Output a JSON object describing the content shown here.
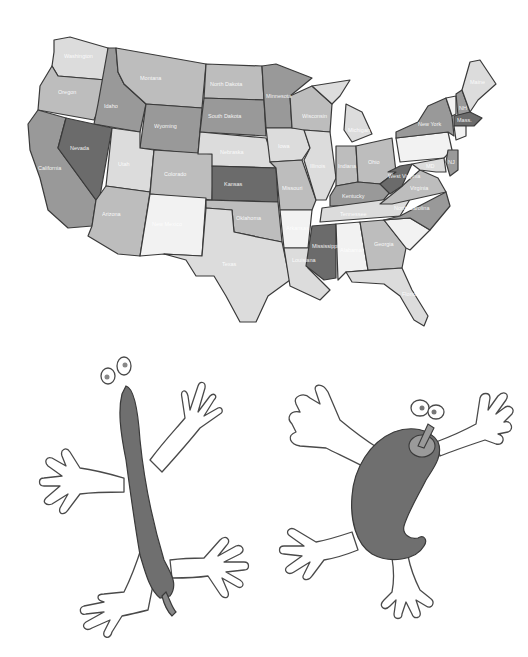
{
  "map": {
    "title": "United States map",
    "colors": {
      "dark": "#6b6b6b",
      "medium": "#999999",
      "light": "#bdbdbd",
      "pale": "#dcdcdc",
      "white": "#f2f2f2",
      "border": "#3a3a3a"
    },
    "states": [
      {
        "name": "Washington",
        "label": "Washington",
        "shade": "pale"
      },
      {
        "name": "Oregon",
        "label": "Oregon",
        "shade": "light"
      },
      {
        "name": "California",
        "label": "California",
        "shade": "medium"
      },
      {
        "name": "Idaho",
        "label": "Idaho",
        "shade": "medium"
      },
      {
        "name": "Nevada",
        "label": "Nevada",
        "shade": "dark"
      },
      {
        "name": "Montana",
        "label": "Montana",
        "shade": "light"
      },
      {
        "name": "Wyoming",
        "label": "Wyoming",
        "shade": "medium"
      },
      {
        "name": "Utah",
        "label": "Utah",
        "shade": "pale"
      },
      {
        "name": "Arizona",
        "label": "Arizona",
        "shade": "light"
      },
      {
        "name": "Colorado",
        "label": "Colorado",
        "shade": "light"
      },
      {
        "name": "New Mexico",
        "label": "New Mexico",
        "shade": "white"
      },
      {
        "name": "North Dakota",
        "label": "North Dakota",
        "shade": "light"
      },
      {
        "name": "South Dakota",
        "label": "South Dakota",
        "shade": "medium"
      },
      {
        "name": "Nebraska",
        "label": "Nebraska",
        "shade": "pale"
      },
      {
        "name": "Kansas",
        "label": "Kansas",
        "shade": "dark"
      },
      {
        "name": "Oklahoma",
        "label": "Oklahoma",
        "shade": "light"
      },
      {
        "name": "Texas",
        "label": "Texas",
        "shade": "pale"
      },
      {
        "name": "Minnesota",
        "label": "Minnesota",
        "shade": "medium"
      },
      {
        "name": "Iowa",
        "label": "Iowa",
        "shade": "pale"
      },
      {
        "name": "Missouri",
        "label": "Missouri",
        "shade": "light"
      },
      {
        "name": "Arkansas",
        "label": "Arkansas",
        "shade": "white"
      },
      {
        "name": "Louisiana",
        "label": "Louisiana",
        "shade": "pale"
      },
      {
        "name": "Wisconsin",
        "label": "Wisconsin",
        "shade": "light"
      },
      {
        "name": "Illinois",
        "label": "Illinois",
        "shade": "pale"
      },
      {
        "name": "Michigan",
        "label": "Michigan",
        "shade": "pale"
      },
      {
        "name": "Indiana",
        "label": "Indiana",
        "shade": "light"
      },
      {
        "name": "Ohio",
        "label": "Ohio",
        "shade": "light"
      },
      {
        "name": "Kentucky",
        "label": "Kentucky",
        "shade": "medium"
      },
      {
        "name": "Tennessee",
        "label": "Tennessee",
        "shade": "pale"
      },
      {
        "name": "Mississippi",
        "label": "Mississippi",
        "shade": "dark"
      },
      {
        "name": "Alabama",
        "label": "Alabama",
        "shade": "white"
      },
      {
        "name": "Georgia",
        "label": "Georgia",
        "shade": "light"
      },
      {
        "name": "Florida",
        "label": "Florida",
        "shade": "pale"
      },
      {
        "name": "South Carolina",
        "label": "",
        "shade": "white"
      },
      {
        "name": "North Carolina",
        "label": "North Carolina",
        "shade": "medium"
      },
      {
        "name": "Virginia",
        "label": "Virginia",
        "shade": "light"
      },
      {
        "name": "West Virginia",
        "label": "West Virginia",
        "shade": "dark"
      },
      {
        "name": "Pennsylvania",
        "label": "",
        "shade": "white"
      },
      {
        "name": "New York",
        "label": "New York",
        "shade": "medium"
      },
      {
        "name": "Maine",
        "label": "Maine",
        "shade": "pale"
      },
      {
        "name": "New Hampshire",
        "label": "NH",
        "shade": "medium"
      },
      {
        "name": "Vermont",
        "label": "",
        "shade": "white"
      },
      {
        "name": "Massachusetts",
        "label": "Mass.",
        "shade": "dark"
      },
      {
        "name": "New Jersey",
        "label": "NJ",
        "shade": "medium"
      },
      {
        "name": "Maryland",
        "label": "MD",
        "shade": "pale"
      }
    ]
  },
  "characters": [
    {
      "name": "long-chili-pepper",
      "description": "long thin dark pepper with eyes, arms and legs"
    },
    {
      "name": "bell-pepper",
      "description": "curved dark pepper with stem, eyes, arms and legs"
    }
  ]
}
